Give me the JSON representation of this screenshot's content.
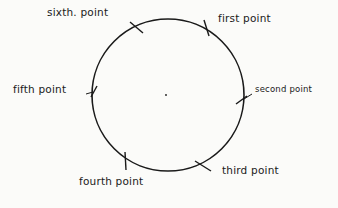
{
  "diagram": {
    "type": "circle-with-labeled-points",
    "stroke_color": "#1a1a1a",
    "background": "#fbfbf9",
    "circle": {
      "cx": 168,
      "cy": 95,
      "r": 76
    },
    "center_dot": {
      "x": 166,
      "y": 95
    },
    "points": [
      {
        "label": "first point",
        "tick": [
          204,
          20,
          209,
          36
        ],
        "label_pos": [
          218,
          14
        ]
      },
      {
        "label": "second point",
        "tick": [
          236,
          104,
          247,
          96
        ],
        "label_pos": [
          256,
          84
        ]
      },
      {
        "label": "third point",
        "tick": [
          195,
          161,
          211,
          171
        ],
        "label_pos": [
          222,
          165
        ]
      },
      {
        "label": "fourth point",
        "tick": [
          125,
          152,
          126,
          170
        ],
        "label_pos": [
          79,
          177
        ]
      },
      {
        "label": "fifth point",
        "tick": [
          91,
          97,
          97,
          86
        ],
        "label_pos": [
          13,
          85
        ]
      },
      {
        "label": "sixth. point",
        "tick": [
          130,
          22,
          143,
          33
        ],
        "label_pos": [
          47,
          8
        ]
      }
    ]
  }
}
